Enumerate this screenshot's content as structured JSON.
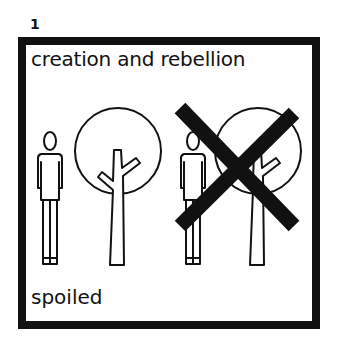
{
  "panel": {
    "number": "1",
    "title": "creation and rebellion",
    "caption": "spoiled",
    "figures": [
      {
        "type": "person",
        "crossed": false
      },
      {
        "type": "tree",
        "crossed": false
      },
      {
        "type": "person",
        "crossed": true
      },
      {
        "type": "tree",
        "crossed": true
      }
    ],
    "colors": {
      "ink": "#111111",
      "background": "#ffffff"
    }
  }
}
